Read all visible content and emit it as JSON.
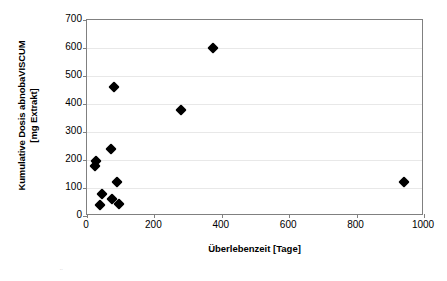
{
  "chart_data": {
    "type": "scatter",
    "title": "",
    "xlabel": "Überlebenzeit [Tage]",
    "ylabel_line1": "Kumulative Dosis abnobaVISCUM",
    "ylabel_line2": "[mg Extrakt]",
    "xlim": [
      0,
      1000
    ],
    "ylim": [
      0,
      700
    ],
    "xticks": [
      0,
      200,
      400,
      600,
      800,
      1000
    ],
    "yticks": [
      0,
      100,
      200,
      300,
      400,
      500,
      600,
      700
    ],
    "xtick_labels": [
      "0",
      "200",
      "400",
      "600",
      "800",
      "1000"
    ],
    "ytick_labels": [
      "0",
      "100",
      "200",
      "300",
      "400",
      "500",
      "600",
      "700"
    ],
    "grid": "horizontal",
    "grid_color": "#e8e8e8",
    "legend": "none",
    "marker": "diamond",
    "marker_color": "#000000",
    "frame_color": "#808080",
    "background": "#ffffff",
    "points": [
      {
        "x": 25,
        "y": 180
      },
      {
        "x": 28,
        "y": 195
      },
      {
        "x": 40,
        "y": 40
      },
      {
        "x": 45,
        "y": 80
      },
      {
        "x": 70,
        "y": 240
      },
      {
        "x": 75,
        "y": 60
      },
      {
        "x": 80,
        "y": 460
      },
      {
        "x": 90,
        "y": 120
      },
      {
        "x": 95,
        "y": 42
      },
      {
        "x": 280,
        "y": 380
      },
      {
        "x": 375,
        "y": 600
      },
      {
        "x": 940,
        "y": 120
      }
    ]
  },
  "artifact": {
    "glyph": "¨"
  }
}
